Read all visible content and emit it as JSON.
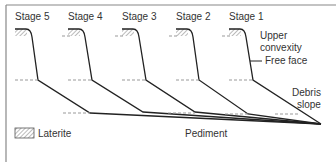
{
  "diagram": {
    "stages": [
      {
        "label": "Stage 5",
        "x": 15
      },
      {
        "label": "Stage 4",
        "x": 68
      },
      {
        "label": "Stage 3",
        "x": 122
      },
      {
        "label": "Stage 2",
        "x": 176
      },
      {
        "label": "Stage 1",
        "x": 229
      }
    ],
    "annotations": {
      "upper_convexity_1": "Upper",
      "upper_convexity_2": "convexity",
      "free_face": "Free face",
      "debris_1": "Debris",
      "debris_2": "slope",
      "pediment": "Pediment"
    },
    "legend": {
      "laterite": "Laterite"
    },
    "colors": {
      "line": "#222222",
      "frame": "#888888",
      "dashed": "#999999",
      "hatch": "#777777"
    }
  }
}
